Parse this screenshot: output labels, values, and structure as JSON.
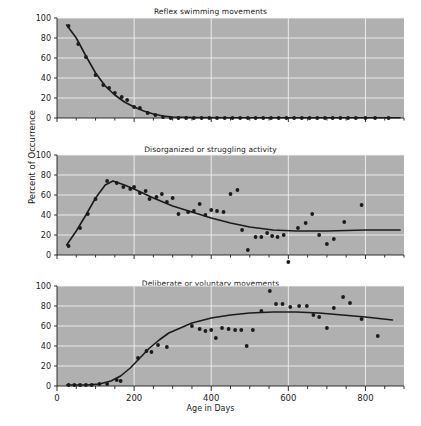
{
  "figure": {
    "ylabel": "Percent of Occurrence",
    "xlabel": "Age in Days",
    "plot_bg": "#b0b0b0",
    "grid_color": "#f2f2f2",
    "ink_color": "#1b1b1b"
  },
  "chart_data": [
    {
      "type": "scatter",
      "title": "Reflex swimming movements",
      "xlabel": "Age in Days",
      "ylabel": "Percent of Occurrence",
      "xlim": [
        0,
        900
      ],
      "ylim": [
        0,
        100
      ],
      "xticks": [
        0,
        200,
        400,
        600,
        800
      ],
      "yticks": [
        0,
        20,
        40,
        60,
        80,
        100
      ],
      "minor_xtick_step": 50,
      "grid": true,
      "legend": "none",
      "points": [
        {
          "x": 30,
          "y": 92
        },
        {
          "x": 55,
          "y": 74
        },
        {
          "x": 75,
          "y": 61
        },
        {
          "x": 100,
          "y": 43
        },
        {
          "x": 120,
          "y": 33
        },
        {
          "x": 135,
          "y": 30
        },
        {
          "x": 150,
          "y": 25
        },
        {
          "x": 168,
          "y": 21
        },
        {
          "x": 182,
          "y": 18
        },
        {
          "x": 200,
          "y": 11
        },
        {
          "x": 215,
          "y": 10
        },
        {
          "x": 235,
          "y": 5
        },
        {
          "x": 255,
          "y": 3
        },
        {
          "x": 275,
          "y": 1
        },
        {
          "x": 295,
          "y": 0
        },
        {
          "x": 315,
          "y": 0
        },
        {
          "x": 335,
          "y": 0
        },
        {
          "x": 355,
          "y": 0
        },
        {
          "x": 375,
          "y": 0
        },
        {
          "x": 395,
          "y": 0
        },
        {
          "x": 415,
          "y": 0
        },
        {
          "x": 435,
          "y": 0
        },
        {
          "x": 455,
          "y": 0
        },
        {
          "x": 475,
          "y": 0
        },
        {
          "x": 495,
          "y": 0
        },
        {
          "x": 515,
          "y": 0
        },
        {
          "x": 535,
          "y": 0
        },
        {
          "x": 555,
          "y": 0
        },
        {
          "x": 575,
          "y": 0
        },
        {
          "x": 595,
          "y": 0
        },
        {
          "x": 615,
          "y": 0
        },
        {
          "x": 635,
          "y": 0
        },
        {
          "x": 655,
          "y": 0
        },
        {
          "x": 675,
          "y": 0
        },
        {
          "x": 695,
          "y": 0
        },
        {
          "x": 715,
          "y": 0
        },
        {
          "x": 735,
          "y": 0
        },
        {
          "x": 755,
          "y": 0
        },
        {
          "x": 775,
          "y": 0
        },
        {
          "x": 800,
          "y": 0
        },
        {
          "x": 825,
          "y": 0
        },
        {
          "x": 860,
          "y": 0
        }
      ],
      "fit_curve": [
        {
          "x": 25,
          "y": 93
        },
        {
          "x": 50,
          "y": 80
        },
        {
          "x": 75,
          "y": 62
        },
        {
          "x": 100,
          "y": 45
        },
        {
          "x": 125,
          "y": 32
        },
        {
          "x": 150,
          "y": 23
        },
        {
          "x": 175,
          "y": 16
        },
        {
          "x": 200,
          "y": 11
        },
        {
          "x": 225,
          "y": 7
        },
        {
          "x": 250,
          "y": 4
        },
        {
          "x": 275,
          "y": 2
        },
        {
          "x": 300,
          "y": 1
        },
        {
          "x": 350,
          "y": 0.5
        },
        {
          "x": 450,
          "y": 0.3
        },
        {
          "x": 600,
          "y": 0.2
        },
        {
          "x": 750,
          "y": 0.2
        },
        {
          "x": 890,
          "y": 0.2
        }
      ]
    },
    {
      "type": "scatter",
      "title": "Disorganized or struggling activity",
      "xlabel": "Age in Days",
      "ylabel": "Percent of Occurrence",
      "xlim": [
        0,
        900
      ],
      "ylim": [
        0,
        100
      ],
      "xticks": [
        0,
        200,
        400,
        600,
        800
      ],
      "yticks": [
        0,
        20,
        40,
        60,
        80,
        100
      ],
      "minor_xtick_step": 50,
      "grid": true,
      "legend": "none",
      "points": [
        {
          "x": 30,
          "y": 9
        },
        {
          "x": 60,
          "y": 27
        },
        {
          "x": 80,
          "y": 41
        },
        {
          "x": 100,
          "y": 56
        },
        {
          "x": 130,
          "y": 74
        },
        {
          "x": 155,
          "y": 72
        },
        {
          "x": 172,
          "y": 68
        },
        {
          "x": 190,
          "y": 66
        },
        {
          "x": 200,
          "y": 68
        },
        {
          "x": 215,
          "y": 62
        },
        {
          "x": 230,
          "y": 64
        },
        {
          "x": 240,
          "y": 56
        },
        {
          "x": 258,
          "y": 58
        },
        {
          "x": 272,
          "y": 61
        },
        {
          "x": 285,
          "y": 53
        },
        {
          "x": 300,
          "y": 57
        },
        {
          "x": 315,
          "y": 41
        },
        {
          "x": 340,
          "y": 43
        },
        {
          "x": 355,
          "y": 44
        },
        {
          "x": 370,
          "y": 51
        },
        {
          "x": 385,
          "y": 40
        },
        {
          "x": 400,
          "y": 45
        },
        {
          "x": 415,
          "y": 44
        },
        {
          "x": 432,
          "y": 43
        },
        {
          "x": 450,
          "y": 61
        },
        {
          "x": 468,
          "y": 65
        },
        {
          "x": 480,
          "y": 25
        },
        {
          "x": 495,
          "y": 5
        },
        {
          "x": 515,
          "y": 18
        },
        {
          "x": 530,
          "y": 18
        },
        {
          "x": 545,
          "y": 22
        },
        {
          "x": 558,
          "y": 19
        },
        {
          "x": 572,
          "y": 18
        },
        {
          "x": 588,
          "y": 20
        },
        {
          "x": 600,
          "y": -7
        },
        {
          "x": 625,
          "y": 27
        },
        {
          "x": 645,
          "y": 32
        },
        {
          "x": 662,
          "y": 41
        },
        {
          "x": 680,
          "y": 20
        },
        {
          "x": 700,
          "y": 11
        },
        {
          "x": 718,
          "y": 16
        },
        {
          "x": 745,
          "y": 33
        },
        {
          "x": 790,
          "y": 50
        }
      ],
      "fit_curve": [
        {
          "x": 25,
          "y": 10
        },
        {
          "x": 50,
          "y": 24
        },
        {
          "x": 75,
          "y": 40
        },
        {
          "x": 100,
          "y": 57
        },
        {
          "x": 125,
          "y": 70
        },
        {
          "x": 145,
          "y": 74
        },
        {
          "x": 175,
          "y": 70
        },
        {
          "x": 200,
          "y": 66
        },
        {
          "x": 250,
          "y": 57
        },
        {
          "x": 300,
          "y": 49
        },
        {
          "x": 350,
          "y": 43
        },
        {
          "x": 400,
          "y": 37
        },
        {
          "x": 450,
          "y": 32
        },
        {
          "x": 500,
          "y": 28
        },
        {
          "x": 560,
          "y": 25
        },
        {
          "x": 620,
          "y": 24
        },
        {
          "x": 700,
          "y": 24
        },
        {
          "x": 800,
          "y": 25
        },
        {
          "x": 890,
          "y": 25
        }
      ]
    },
    {
      "type": "scatter",
      "title": "Deliberate or voluntary movements",
      "xlabel": "Age in Days",
      "ylabel": "Percent of Occurrence",
      "xlim": [
        0,
        900
      ],
      "ylim": [
        0,
        100
      ],
      "xticks": [
        0,
        200,
        400,
        600,
        800
      ],
      "yticks": [
        0,
        20,
        40,
        60,
        80,
        100
      ],
      "minor_xtick_step": 50,
      "grid": true,
      "legend": "none",
      "points": [
        {
          "x": 30,
          "y": 1
        },
        {
          "x": 45,
          "y": 1
        },
        {
          "x": 60,
          "y": 1
        },
        {
          "x": 75,
          "y": 1
        },
        {
          "x": 90,
          "y": 1
        },
        {
          "x": 110,
          "y": 2
        },
        {
          "x": 130,
          "y": 2
        },
        {
          "x": 155,
          "y": 6
        },
        {
          "x": 165,
          "y": 5
        },
        {
          "x": 210,
          "y": 28
        },
        {
          "x": 232,
          "y": 35
        },
        {
          "x": 245,
          "y": 34
        },
        {
          "x": 262,
          "y": 41
        },
        {
          "x": 285,
          "y": 39
        },
        {
          "x": 350,
          "y": 60
        },
        {
          "x": 370,
          "y": 57
        },
        {
          "x": 385,
          "y": 55
        },
        {
          "x": 400,
          "y": 56
        },
        {
          "x": 412,
          "y": 48
        },
        {
          "x": 428,
          "y": 58
        },
        {
          "x": 445,
          "y": 57
        },
        {
          "x": 462,
          "y": 56
        },
        {
          "x": 478,
          "y": 56
        },
        {
          "x": 492,
          "y": 40
        },
        {
          "x": 508,
          "y": 56
        },
        {
          "x": 530,
          "y": 75
        },
        {
          "x": 552,
          "y": 95
        },
        {
          "x": 568,
          "y": 82
        },
        {
          "x": 585,
          "y": 82
        },
        {
          "x": 605,
          "y": 79
        },
        {
          "x": 628,
          "y": 80
        },
        {
          "x": 648,
          "y": 80
        },
        {
          "x": 665,
          "y": 71
        },
        {
          "x": 680,
          "y": 69
        },
        {
          "x": 700,
          "y": 58
        },
        {
          "x": 718,
          "y": 78
        },
        {
          "x": 742,
          "y": 89
        },
        {
          "x": 760,
          "y": 83
        },
        {
          "x": 790,
          "y": 67
        },
        {
          "x": 832,
          "y": 50
        }
      ],
      "fit_curve": [
        {
          "x": 25,
          "y": 1
        },
        {
          "x": 75,
          "y": 1
        },
        {
          "x": 110,
          "y": 2
        },
        {
          "x": 140,
          "y": 5
        },
        {
          "x": 165,
          "y": 10
        },
        {
          "x": 190,
          "y": 18
        },
        {
          "x": 215,
          "y": 28
        },
        {
          "x": 240,
          "y": 38
        },
        {
          "x": 265,
          "y": 46
        },
        {
          "x": 290,
          "y": 53
        },
        {
          "x": 320,
          "y": 58
        },
        {
          "x": 350,
          "y": 63
        },
        {
          "x": 400,
          "y": 68
        },
        {
          "x": 450,
          "y": 71
        },
        {
          "x": 500,
          "y": 73
        },
        {
          "x": 560,
          "y": 74
        },
        {
          "x": 620,
          "y": 74
        },
        {
          "x": 680,
          "y": 73
        },
        {
          "x": 740,
          "y": 71
        },
        {
          "x": 800,
          "y": 69
        },
        {
          "x": 870,
          "y": 66
        }
      ]
    }
  ]
}
